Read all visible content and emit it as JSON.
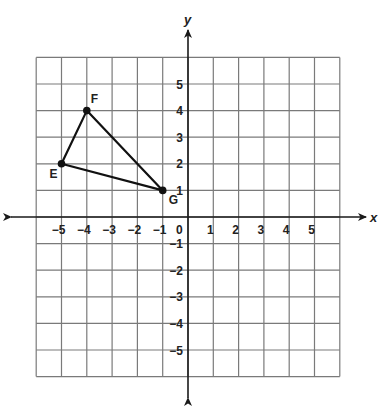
{
  "diagram": {
    "type": "coordinate-plane",
    "axes": {
      "x_label": "x",
      "y_label": "y",
      "origin_label": "0",
      "x_range": [
        -6,
        6
      ],
      "y_range": [
        -6,
        6
      ],
      "x_ticks": [
        {
          "value": -5,
          "label": "−5"
        },
        {
          "value": -4,
          "label": "−4"
        },
        {
          "value": -3,
          "label": "−3"
        },
        {
          "value": -2,
          "label": "−2"
        },
        {
          "value": -1,
          "label": "−1"
        },
        {
          "value": 1,
          "label": "1"
        },
        {
          "value": 2,
          "label": "2"
        },
        {
          "value": 3,
          "label": "3"
        },
        {
          "value": 4,
          "label": "4"
        },
        {
          "value": 5,
          "label": "5"
        }
      ],
      "y_ticks": [
        {
          "value": 5,
          "label": "5"
        },
        {
          "value": 4,
          "label": "4"
        },
        {
          "value": 3,
          "label": "3"
        },
        {
          "value": 2,
          "label": "2"
        },
        {
          "value": 1,
          "label": "1"
        },
        {
          "value": -1,
          "label": "−1"
        },
        {
          "value": -2,
          "label": "−2"
        },
        {
          "value": -3,
          "label": "−3"
        },
        {
          "value": -4,
          "label": "−4"
        },
        {
          "value": -5,
          "label": "−5"
        }
      ]
    },
    "triangle": {
      "name": "EFG",
      "points": [
        {
          "label": "E",
          "x": -5,
          "y": 2
        },
        {
          "label": "F",
          "x": -4,
          "y": 4
        },
        {
          "label": "G",
          "x": -1,
          "y": 1
        }
      ]
    },
    "colors": {
      "grid": "#7a7a7a",
      "axis": "#1a1a1a",
      "shape": "#111111"
    }
  }
}
